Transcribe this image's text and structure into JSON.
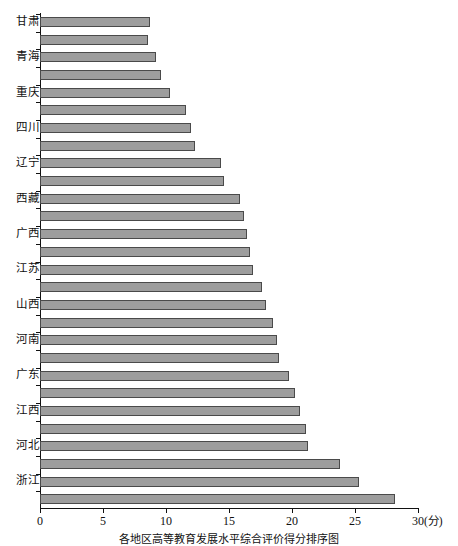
{
  "chart_data": {
    "type": "bar",
    "orientation": "horizontal",
    "title": "",
    "caption": "各地区高等教育发展水平综合评价得分排序图",
    "xlabel": "(分)",
    "ylabel": "",
    "xlim": [
      0,
      30
    ],
    "xticks": [
      0,
      5,
      10,
      15,
      20,
      25,
      30
    ],
    "xticklabels": [
      "0",
      "5",
      "10",
      "15",
      "20",
      "25",
      "30"
    ],
    "grid": false,
    "legend": false,
    "bar_color": "#9d9d9d",
    "bar_edge_color": "#4a4a4a",
    "axis_color": "#111111",
    "background": "#ffffff",
    "note": "Y-axis labels are printed on alternating bars only (every other category is unlabeled in the source image).",
    "categories": [
      "甘肃",
      "",
      "青海",
      "",
      "重庆",
      "",
      "四川",
      "",
      "辽宁",
      "",
      "西藏",
      "",
      "广西",
      "",
      "江苏",
      "",
      "山西",
      "",
      "河南",
      "",
      "广东",
      "",
      "江西",
      "",
      "河北",
      "",
      "浙江",
      "",
      "福建",
      "",
      "北京"
    ],
    "bars": [
      {
        "label": "甘肃",
        "value": 8.7
      },
      {
        "label": "",
        "value": 8.6
      },
      {
        "label": "青海",
        "value": 9.2
      },
      {
        "label": "",
        "value": 9.6
      },
      {
        "label": "重庆",
        "value": 10.3
      },
      {
        "label": "",
        "value": 11.6
      },
      {
        "label": "四川",
        "value": 12.0
      },
      {
        "label": "",
        "value": 12.3
      },
      {
        "label": "辽宁",
        "value": 14.4
      },
      {
        "label": "",
        "value": 14.6
      },
      {
        "label": "西藏",
        "value": 15.9
      },
      {
        "label": "",
        "value": 16.2
      },
      {
        "label": "广西",
        "value": 16.4
      },
      {
        "label": "",
        "value": 16.7
      },
      {
        "label": "江苏",
        "value": 16.9
      },
      {
        "label": "",
        "value": 17.6
      },
      {
        "label": "山西",
        "value": 17.9
      },
      {
        "label": "",
        "value": 18.5
      },
      {
        "label": "河南",
        "value": 18.8
      },
      {
        "label": "",
        "value": 19.0
      },
      {
        "label": "广东",
        "value": 19.8
      },
      {
        "label": "",
        "value": 20.2
      },
      {
        "label": "江西",
        "value": 20.6
      },
      {
        "label": "",
        "value": 21.1
      },
      {
        "label": "河北",
        "value": 21.3
      },
      {
        "label": "",
        "value": 23.8
      },
      {
        "label": "浙江",
        "value": 25.3
      },
      {
        "label": "",
        "value": 28.2
      }
    ]
  }
}
